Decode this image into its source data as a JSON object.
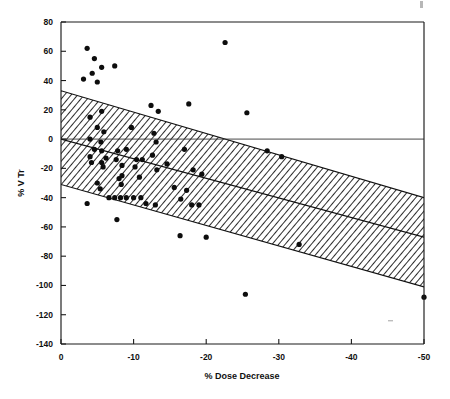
{
  "figure": {
    "name": "scatter-regression-plot",
    "background": "#ffffff",
    "ink_color": "#101010"
  },
  "chart_data": {
    "type": "scatter",
    "title": "",
    "xlabel": "% Dose Decrease",
    "ylabel": "% V Tr",
    "xlim": [
      0,
      -50
    ],
    "ylim": [
      -140,
      80
    ],
    "x_ticks": [
      0,
      -10,
      -20,
      -30,
      -40,
      -50
    ],
    "x_tick_labels": [
      "0",
      "-10",
      "-20",
      "-30",
      "-40",
      "-50"
    ],
    "y_ticks": [
      80,
      60,
      40,
      20,
      0,
      -20,
      -40,
      -60,
      -80,
      -100,
      -120,
      -140
    ],
    "y_tick_labels": [
      "80",
      "60",
      "40",
      "20",
      "0",
      "-20",
      "-40",
      "-60",
      "-80",
      "-100",
      "-120",
      "-140"
    ],
    "grid": false,
    "legend": null,
    "zero_reference_line": {
      "y": 0,
      "description": "horizontal reference line at % V Tr = 0 spanning full width"
    },
    "regression_line": {
      "description": "fitted least-squares line through the scatter",
      "x_start": 0,
      "y_start": 0,
      "x_end": -50,
      "y_end": -67,
      "slope_per_unit_x": 1.34,
      "intercept": 0
    },
    "confidence_band": {
      "description": "hatched (diagonal line fill) prediction band around the regression line",
      "fill_style": "diagonal-hatch",
      "upper_x_start": 0,
      "upper_y_start": 33,
      "upper_x_end": -50,
      "upper_y_end": -40,
      "lower_x_start": 0,
      "lower_y_start": -31,
      "lower_x_end": -50,
      "lower_y_end": -101
    },
    "points": [
      {
        "x": -3.6,
        "y": 62
      },
      {
        "x": -4.6,
        "y": 55
      },
      {
        "x": -5.6,
        "y": 49
      },
      {
        "x": -7.4,
        "y": 50
      },
      {
        "x": -3.1,
        "y": 41
      },
      {
        "x": -4.3,
        "y": 45
      },
      {
        "x": -5.0,
        "y": 39
      },
      {
        "x": -4.0,
        "y": 15
      },
      {
        "x": -5.6,
        "y": 19
      },
      {
        "x": -5.0,
        "y": 8
      },
      {
        "x": -5.9,
        "y": 5
      },
      {
        "x": -4.0,
        "y": 0
      },
      {
        "x": -5.5,
        "y": -2
      },
      {
        "x": -4.6,
        "y": -7
      },
      {
        "x": -5.6,
        "y": -8
      },
      {
        "x": -6.2,
        "y": -13
      },
      {
        "x": -4.0,
        "y": -12
      },
      {
        "x": -4.2,
        "y": -16
      },
      {
        "x": -5.6,
        "y": -16
      },
      {
        "x": -5.8,
        "y": -19
      },
      {
        "x": -5.0,
        "y": -30
      },
      {
        "x": -5.4,
        "y": -34
      },
      {
        "x": -6.6,
        "y": -40
      },
      {
        "x": -7.4,
        "y": -40
      },
      {
        "x": -8.2,
        "y": -40
      },
      {
        "x": -9.0,
        "y": -40
      },
      {
        "x": -3.6,
        "y": -44
      },
      {
        "x": -7.7,
        "y": -55
      },
      {
        "x": -8.3,
        "y": -31
      },
      {
        "x": -8.0,
        "y": -27
      },
      {
        "x": -8.4,
        "y": -25
      },
      {
        "x": -7.6,
        "y": -14
      },
      {
        "x": -8.4,
        "y": -18
      },
      {
        "x": -7.8,
        "y": -8
      },
      {
        "x": -9.0,
        "y": -7
      },
      {
        "x": -9.7,
        "y": 8
      },
      {
        "x": -10.4,
        "y": -14
      },
      {
        "x": -11.2,
        "y": -14
      },
      {
        "x": -10.2,
        "y": -19
      },
      {
        "x": -10.8,
        "y": -26
      },
      {
        "x": -10.0,
        "y": -40
      },
      {
        "x": -11.0,
        "y": -40
      },
      {
        "x": -11.7,
        "y": -44
      },
      {
        "x": -12.4,
        "y": 23
      },
      {
        "x": -13.4,
        "y": 19
      },
      {
        "x": -12.8,
        "y": 4
      },
      {
        "x": -13.1,
        "y": -2
      },
      {
        "x": -12.6,
        "y": -11
      },
      {
        "x": -13.2,
        "y": -21
      },
      {
        "x": -13.0,
        "y": -45
      },
      {
        "x": -14.6,
        "y": -17
      },
      {
        "x": -15.6,
        "y": -33
      },
      {
        "x": -16.5,
        "y": -41
      },
      {
        "x": -17.3,
        "y": -35
      },
      {
        "x": -17.6,
        "y": 24
      },
      {
        "x": -17.0,
        "y": -7
      },
      {
        "x": -18.2,
        "y": -21
      },
      {
        "x": -18.0,
        "y": -45
      },
      {
        "x": -19.0,
        "y": -45
      },
      {
        "x": -19.4,
        "y": -24
      },
      {
        "x": -16.4,
        "y": -66
      },
      {
        "x": -20.0,
        "y": -67
      },
      {
        "x": -22.6,
        "y": 66
      },
      {
        "x": -25.6,
        "y": 18
      },
      {
        "x": -28.4,
        "y": -8
      },
      {
        "x": -30.4,
        "y": -12
      },
      {
        "x": -32.8,
        "y": -72
      },
      {
        "x": -25.4,
        "y": -106
      },
      {
        "x": -50.0,
        "y": -108
      }
    ],
    "marker": {
      "shape": "circle",
      "color": "#0d0d0d",
      "size_px": 4.6
    },
    "n_points": 69
  },
  "artifacts": {
    "top_right_speck": "scan-artifact",
    "bottom_right_speck": "scan-artifact"
  }
}
